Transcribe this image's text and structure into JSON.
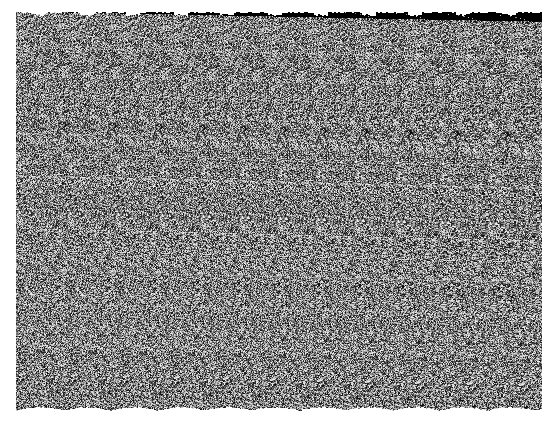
{
  "page": {
    "title": "Random-Dot Autostereogram",
    "width": 557,
    "height": 425,
    "background_color": "#ffffff"
  },
  "image": {
    "kind": "random-dot-autostereogram",
    "alt_text": "Random-dot autostereogram: a rectangular field of fine grayscale noise on a white background, with horizontally repeating vertical bands that encode a hidden three-dimensional shape.",
    "field": {
      "x": 16,
      "y": 12,
      "width": 526,
      "height": 400,
      "dot_size_px": 1,
      "grain": "uniform random grayscale per pixel",
      "mean_gray": "#808080",
      "min_gray": "#0a0a0a",
      "max_gray": "#f5f5f5",
      "contrast": 1.0
    },
    "stereo": {
      "pattern_period_px": 47,
      "near_period_px": 38,
      "far_period_px": 52,
      "band_count": 11,
      "eye_separation_px": 47,
      "depth_levels": 5,
      "edge_profile_top": "ragged notched",
      "edge_profile_bottom": "ragged sawtooth",
      "hidden_shape_hint": "central raised relief surrounded by background plane"
    },
    "depth_map": {
      "description": "Normalized depth per grid cell, 0 = background plane (far), 1 = nearest raised surface. 16 columns by 12 rows covering the noise field.",
      "cols": 16,
      "rows": 12,
      "values": [
        [
          0.0,
          0.0,
          0.0,
          0.0,
          0.0,
          0.05,
          0.1,
          0.12,
          0.12,
          0.1,
          0.05,
          0.0,
          0.0,
          0.0,
          0.0,
          0.0
        ],
        [
          0.0,
          0.0,
          0.0,
          0.05,
          0.12,
          0.22,
          0.32,
          0.38,
          0.38,
          0.32,
          0.22,
          0.12,
          0.05,
          0.0,
          0.0,
          0.0
        ],
        [
          0.0,
          0.0,
          0.06,
          0.16,
          0.3,
          0.45,
          0.58,
          0.64,
          0.64,
          0.58,
          0.45,
          0.3,
          0.16,
          0.06,
          0.0,
          0.0
        ],
        [
          0.0,
          0.04,
          0.14,
          0.3,
          0.48,
          0.64,
          0.76,
          0.82,
          0.82,
          0.76,
          0.64,
          0.48,
          0.3,
          0.14,
          0.04,
          0.0
        ],
        [
          0.0,
          0.08,
          0.22,
          0.42,
          0.62,
          0.78,
          0.9,
          0.96,
          0.96,
          0.9,
          0.78,
          0.62,
          0.42,
          0.22,
          0.08,
          0.0
        ],
        [
          0.02,
          0.1,
          0.26,
          0.48,
          0.68,
          0.84,
          0.96,
          1.0,
          1.0,
          0.96,
          0.84,
          0.68,
          0.48,
          0.26,
          0.1,
          0.02
        ],
        [
          0.02,
          0.1,
          0.26,
          0.48,
          0.68,
          0.84,
          0.96,
          1.0,
          1.0,
          0.96,
          0.84,
          0.68,
          0.48,
          0.26,
          0.1,
          0.02
        ],
        [
          0.0,
          0.08,
          0.22,
          0.42,
          0.62,
          0.78,
          0.9,
          0.96,
          0.96,
          0.9,
          0.78,
          0.62,
          0.42,
          0.22,
          0.08,
          0.0
        ],
        [
          0.0,
          0.04,
          0.14,
          0.3,
          0.48,
          0.64,
          0.76,
          0.82,
          0.82,
          0.76,
          0.64,
          0.48,
          0.3,
          0.14,
          0.04,
          0.0
        ],
        [
          0.0,
          0.0,
          0.06,
          0.16,
          0.3,
          0.45,
          0.58,
          0.64,
          0.64,
          0.58,
          0.45,
          0.3,
          0.16,
          0.06,
          0.0,
          0.0
        ],
        [
          0.0,
          0.0,
          0.0,
          0.05,
          0.12,
          0.22,
          0.32,
          0.38,
          0.38,
          0.32,
          0.22,
          0.12,
          0.05,
          0.0,
          0.0,
          0.0
        ],
        [
          0.0,
          0.0,
          0.0,
          0.0,
          0.0,
          0.05,
          0.1,
          0.12,
          0.12,
          0.1,
          0.05,
          0.0,
          0.0,
          0.0,
          0.0,
          0.0
        ]
      ]
    }
  }
}
